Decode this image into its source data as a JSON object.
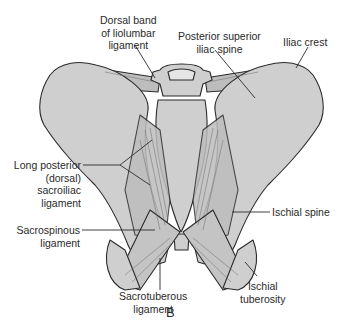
{
  "figure": {
    "panel_letter": "B",
    "colors": {
      "bone_fill": "#cfcfcf",
      "ligament_fill": "#bdbdbd",
      "outline": "#2b2b2b",
      "text": "#2a2a2a",
      "background": "#ffffff"
    },
    "labels": [
      {
        "id": "dorsal-band-iliolumbar",
        "lines": [
          "Dorsal band",
          "of liolumbar",
          "ligament"
        ]
      },
      {
        "id": "posterior-superior-iliac-spine",
        "lines": [
          "Posterior superior",
          "iliac spine"
        ]
      },
      {
        "id": "iliac-crest",
        "lines": [
          "Iliac crest"
        ]
      },
      {
        "id": "long-posterior-sacroiliac",
        "lines": [
          "Long posterior",
          "(dorsal)",
          "sacroiliac",
          "ligament"
        ]
      },
      {
        "id": "sacrospinous",
        "lines": [
          "Sacrospinous",
          "ligament"
        ]
      },
      {
        "id": "ischial-spine",
        "lines": [
          "Ischial spine"
        ]
      },
      {
        "id": "sacrotuberous",
        "lines": [
          "Sacrotuberous",
          "ligament"
        ]
      },
      {
        "id": "ischial-tuberosity",
        "lines": [
          "Ischial",
          "tuberosity"
        ]
      }
    ]
  }
}
